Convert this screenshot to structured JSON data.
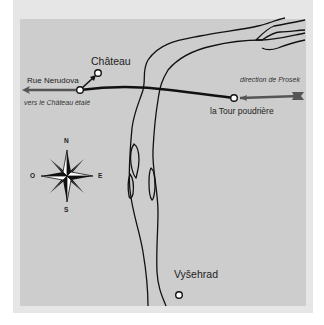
{
  "map": {
    "places": {
      "chateau": "Château",
      "tour": "la Tour poudrière",
      "vysehrad": "Vyšehrad"
    },
    "streets": {
      "rue_nerudova": "Rue Nerudova"
    },
    "directions": {
      "west_note": "vers le Château étalé",
      "east_note": "direction de Prosek"
    },
    "compass": {
      "north": "N",
      "south": "S",
      "east": "E",
      "west": "O"
    },
    "colors": {
      "background": "#ffffff",
      "frame": "#e6e6e6",
      "panel": "#cdcdcd",
      "route": "#111111",
      "arrow": "#555555",
      "river_outline": "#111111"
    }
  }
}
